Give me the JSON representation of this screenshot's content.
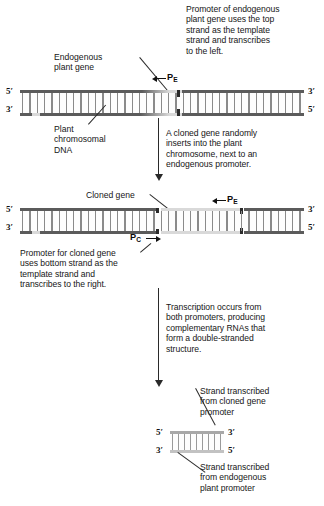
{
  "figure": {
    "type": "molecular-biology-diagram"
  },
  "annotations": {
    "endogenous_promoter_note": "Promoter of endogenous\nplant gene uses the top\nstrand as the template\nstrand and transcribes\nto the left.",
    "endogenous_gene_label": "Endogenous\nplant gene",
    "plant_chromosomal_dna_label": "Plant\nchromosomal\nDNA",
    "insertion_note": "A cloned gene randomly\ninserts into the plant\nchromosome, next to an\nendogenous promoter.",
    "cloned_gene_label": "Cloned gene",
    "cloned_promoter_note": "Promoter for cloned gene\nuses bottom strand as the\ntemplate strand and\ntranscribes to the right.",
    "transcription_note": "Transcription occurs from\nboth promoters, producing\ncomplementary RNAs that\nform a double-stranded\nstructure.",
    "strand_from_cloned_label": "Strand transcribed\nfrom cloned gene\npromoter",
    "strand_from_endogenous_label": "Strand transcribed\nfrom endogenous\nplant promoter"
  },
  "promoters": {
    "endogenous": {
      "symbol": "P",
      "subscript": "E",
      "direction": "left"
    },
    "cloned": {
      "symbol": "P",
      "subscript": "C",
      "direction": "right"
    }
  },
  "dna_panels": [
    {
      "id": "panel-1-endogenous-chromosome",
      "ends": {
        "top_left": "5′",
        "top_right": "3′",
        "bottom_left": "3′",
        "bottom_right": "5′"
      }
    },
    {
      "id": "panel-2-with-cloned-insert",
      "ends": {
        "top_left": "5′",
        "top_right": "3′",
        "bottom_left": "3′",
        "bottom_right": "5′"
      }
    },
    {
      "id": "panel-3-double-stranded-rna",
      "ends": {
        "top_left": "5′",
        "top_right": "3′",
        "bottom_left": "3′",
        "bottom_right": "5′"
      }
    }
  ],
  "colors": {
    "background": "#ffffff",
    "text": "#161616",
    "dark_strand": "#5b5b5b",
    "light_strand": "#d9d9d9",
    "rung": "#8d8d8d",
    "arrow": "#2a2a2a"
  }
}
